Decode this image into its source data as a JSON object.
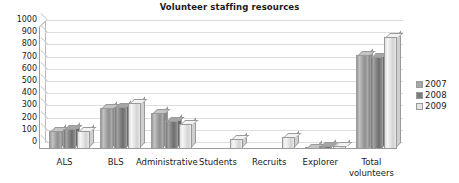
{
  "chart_data": {
    "type": "bar",
    "title": "Volunteer staffing resources",
    "xlabel": "",
    "ylabel": "",
    "ylim": [
      0,
      1000
    ],
    "ytick_step": 100,
    "yticks": [
      1000,
      900,
      800,
      700,
      600,
      500,
      400,
      300,
      200,
      100,
      0
    ],
    "grid": true,
    "legend_position": "right",
    "categories": [
      "ALS",
      "BLS",
      "Administrative",
      "Students",
      "Recruits",
      "Explorer",
      "Total volunteers"
    ],
    "series": [
      {
        "name": "2007",
        "color": "#a8a8a8",
        "values": [
          150,
          335,
          295,
          0,
          0,
          10,
          775
        ]
      },
      {
        "name": "2008",
        "color": "#7c7c7c",
        "values": [
          165,
          345,
          230,
          0,
          0,
          25,
          755
        ]
      },
      {
        "name": "2009",
        "color": "#e4e4e4",
        "values": [
          145,
          380,
          205,
          85,
          95,
          25,
          915
        ]
      }
    ]
  }
}
